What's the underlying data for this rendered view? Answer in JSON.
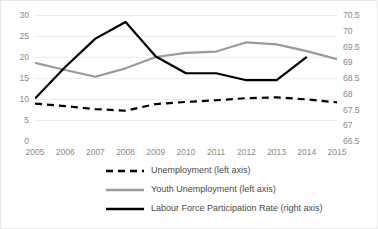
{
  "chart_data": {
    "type": "line",
    "title": "",
    "xlabel": "",
    "ylabel": "",
    "grid": true,
    "legend_position": "bottom",
    "categories": [
      "2005",
      "2006",
      "2007",
      "2008",
      "2009",
      "2010",
      "2011",
      "2012",
      "2013",
      "2014",
      "2015"
    ],
    "axes": {
      "left": {
        "label": "left axis",
        "ylim": [
          0,
          30
        ],
        "ticks": [
          0,
          5,
          10,
          15,
          20,
          25,
          30
        ],
        "tick_labels": [
          "0",
          "5",
          "10",
          "15",
          "20",
          "25",
          "30"
        ]
      },
      "right": {
        "label": "right axis",
        "ylim": [
          66.5,
          70.5
        ],
        "ticks": [
          66.5,
          67,
          67.5,
          68,
          68.5,
          69,
          69.5,
          70,
          70.5
        ],
        "tick_labels": [
          "66.5",
          "67",
          "67.5",
          "68",
          "68.5",
          "69",
          "69.5",
          "70",
          "70.5"
        ]
      }
    },
    "series": [
      {
        "name": "Unemployment (left axis)",
        "axis": "left",
        "style": "dashed",
        "color": "#000000",
        "x": [
          "2005",
          "2006",
          "2007",
          "2008",
          "2009",
          "2010",
          "2011",
          "2012",
          "2013",
          "2014",
          "2015"
        ],
        "values": [
          8.9,
          8.3,
          7.6,
          7.2,
          8.8,
          9.3,
          9.7,
          10.2,
          10.4,
          9.9,
          9.2
        ]
      },
      {
        "name": "Youth Unemployment (left axis)",
        "axis": "left",
        "style": "solid",
        "color": "#9a9a9a",
        "x": [
          "2005",
          "2006",
          "2007",
          "2008",
          "2009",
          "2010",
          "2011",
          "2012",
          "2013",
          "2014",
          "2015"
        ],
        "values": [
          18.6,
          16.9,
          15.3,
          17.3,
          20.0,
          21.0,
          21.3,
          23.5,
          23.0,
          21.4,
          19.5
        ]
      },
      {
        "name": "Labour Force Participation Rate (right axis)",
        "axis": "right",
        "style": "solid",
        "color": "#000000",
        "x": [
          "2005",
          "2006",
          "2007",
          "2008",
          "2009",
          "2010",
          "2011",
          "2012",
          "2013",
          "2014"
        ],
        "values": [
          67.85,
          68.85,
          69.75,
          70.28,
          69.18,
          68.65,
          68.65,
          68.43,
          68.43,
          69.17
        ]
      }
    ]
  },
  "legend": {
    "items": [
      {
        "label": "Unemployment (left axis)",
        "style": "dashed",
        "color": "#000000"
      },
      {
        "label": "Youth Unemployment (left axis)",
        "style": "solid",
        "color": "#9a9a9a"
      },
      {
        "label": "Labour Force Participation Rate (right axis)",
        "style": "solid",
        "color": "#000000"
      }
    ]
  }
}
